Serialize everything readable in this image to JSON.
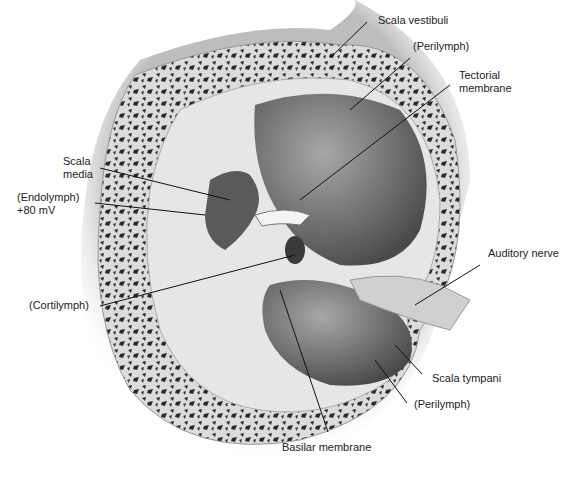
{
  "figure": {
    "labels": {
      "scala_vestibuli": "Scala vestibuli",
      "perilymph_top": "(Perilymph)",
      "tectorial_1": "Tectorial",
      "tectorial_2": "membrane",
      "scala_media_1": "Scala",
      "scala_media_2": "media",
      "endolymph_1": "(Endolymph)",
      "endolymph_2": "+80 mV",
      "auditory_nerve": "Auditory nerve",
      "cortilymph": "(Cortilymph)",
      "scala_tympani": "Scala tympani",
      "perilymph_bottom": "(Perilymph)",
      "basilar_membrane": "Basilar membrane"
    },
    "colors": {
      "bone": "#d8d8d8",
      "bone_pores": "#2a2a2a",
      "chamber": "#6e6e6e",
      "chamber_light": "#9a9a9a",
      "tissue": "#c8c8c8",
      "text": "#222222"
    }
  }
}
